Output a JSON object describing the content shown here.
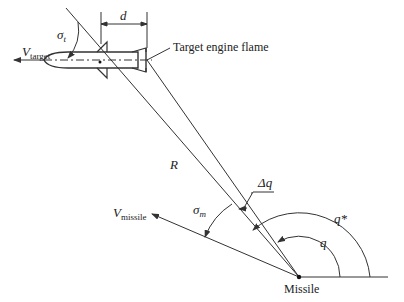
{
  "diagram": {
    "type": "guidance-geometry",
    "labels": {
      "v_target": "V",
      "v_target_sub": "target",
      "sigma_t": "σ",
      "sigma_t_sub": "t",
      "d": "d",
      "engine_flame": "Target engine flame",
      "R": "R",
      "delta_q": "Δq",
      "v_missile": "V",
      "v_missile_sub": "missile",
      "sigma_m": "σ",
      "sigma_m_sub": "m",
      "q_star": "q*",
      "q": "q",
      "missile": "Missile"
    },
    "colors": {
      "line": "#333333",
      "text": "#222222",
      "background": "#ffffff"
    }
  }
}
